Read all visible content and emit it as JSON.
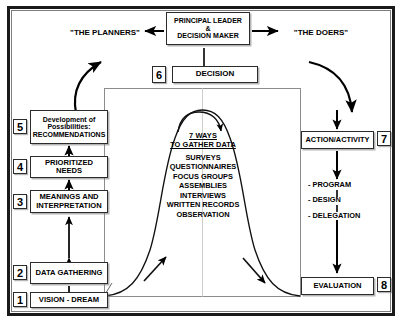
{
  "diagram": {
    "header": {
      "principal_box": {
        "line1": "PRINCIPAL LEADER",
        "line2": "&",
        "line3": "DECISION MAKER"
      },
      "left_label": "\"THE PLANNERS\"",
      "right_label": "\"THE DOERS\""
    },
    "decision": {
      "number": "6",
      "label": "DECISION"
    },
    "center": {
      "heading_line1": "7 WAYS",
      "heading_line2": "TO GATHER DATA",
      "items": [
        "SURVEYS",
        "QUESTIONNAIRES",
        "FOCUS GROUPS",
        "ASSEMBLIES",
        "INTERVIEWS",
        "WRITTEN RECORDS",
        "OBSERVATION"
      ]
    },
    "left_column": [
      {
        "number": "5",
        "line1": "Development of",
        "line2": "Possibilities:",
        "line3": "RECOMMENDATIONS"
      },
      {
        "number": "4",
        "line1": "PRIORITIZED",
        "line2": "NEEDS"
      },
      {
        "number": "3",
        "line1": "MEANINGS AND",
        "line2": "INTERPRETATION"
      },
      {
        "number": "2",
        "line1": "DATA",
        "line2": "GATHERING"
      },
      {
        "number": "1",
        "line1": "VISION - DREAM"
      }
    ],
    "right_column": {
      "action": {
        "number": "7",
        "label": "ACTION/ACTIVITY"
      },
      "steps": [
        "- PROGRAM",
        "- DESIGN",
        "- DELEGATION"
      ],
      "evaluation": {
        "number": "8",
        "label": "EVALUATION"
      }
    },
    "colors": {
      "ink": "#000000",
      "frame": "#1a1a1a",
      "inner_frame": "#8c8c8c",
      "background": "#ffffff"
    }
  }
}
